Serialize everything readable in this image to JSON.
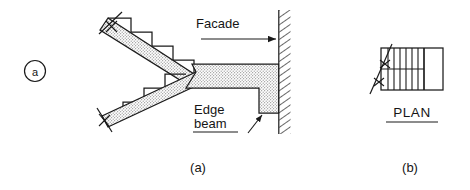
{
  "figure": {
    "marker": "a",
    "panels": [
      {
        "id": "a",
        "caption": "(a)",
        "kind": "section-elevation"
      },
      {
        "id": "b",
        "caption": "(b)",
        "kind": "plan"
      }
    ]
  },
  "labels": {
    "facade": "Facade",
    "edge_beam_line1": "Edge",
    "edge_beam_line2": "beam",
    "plan": "PLAN"
  },
  "colors": {
    "line": "#1a1a1a",
    "stipple_fill": "#d9d9d9",
    "hatch": "#2a2a2a",
    "background": "#ffffff"
  },
  "drawing": {
    "upper_flight": {
      "steps": 4,
      "direction": "descending-right"
    },
    "lower_flight": {
      "steps": 4,
      "direction": "descending-left"
    },
    "break_marks_section": 2,
    "break_marks_plan": 2,
    "plan_treads": 7,
    "facade_wall": {
      "hatched": true,
      "side": "right"
    },
    "edge_beam": {
      "stippled": true,
      "notched": true
    }
  }
}
